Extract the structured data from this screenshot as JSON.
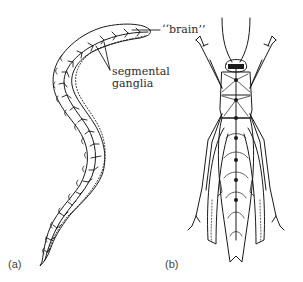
{
  "figure": {
    "panels": [
      {
        "id": "a",
        "label": "(a)",
        "subject": "segmented worm (annelid) nervous system",
        "annotations": [
          {
            "text": "““brain””",
            "target": "anterior ganglion"
          },
          {
            "text": "segmental",
            "target": "segmental ganglia"
          },
          {
            "text": "ganglia",
            "target": "segmental ganglia"
          }
        ]
      },
      {
        "id": "b",
        "label": "(b)",
        "subject": "insect (grasshopper) nervous system, dorsal view",
        "annotations": []
      }
    ]
  },
  "labels": {
    "brain": "‘‘brain’’",
    "segmental_line1": "segmental",
    "segmental_line2": "ganglia",
    "panel_a": "(a)",
    "panel_b": "(b)"
  },
  "colors": {
    "ink": "#1a1a1a",
    "background": "#ffffff",
    "text": "#2b2b2b"
  }
}
